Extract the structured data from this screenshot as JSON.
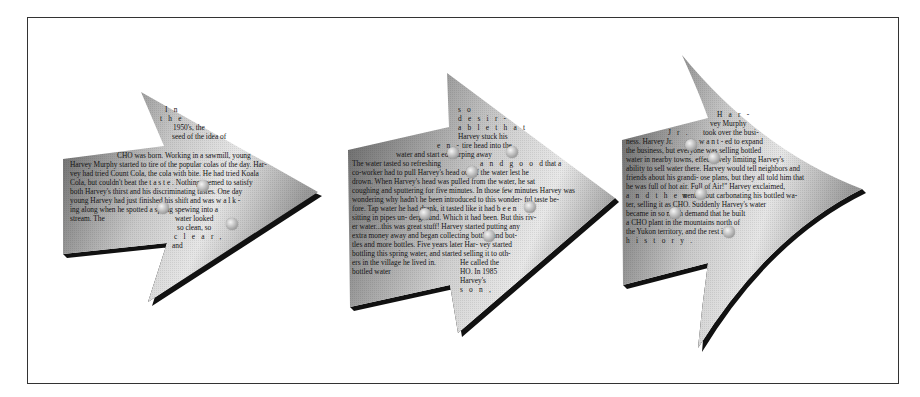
{
  "panels": [
    {
      "id": "arrow-1",
      "lines": [
        {
          "text": "I n",
          "x": 165,
          "y": 112,
          "spaced": true
        },
        {
          "text": "t h e",
          "x": 160,
          "y": 121,
          "spaced": true
        },
        {
          "text": "1950's, the",
          "x": 173,
          "y": 130
        },
        {
          "text": "seed of the idea of",
          "x": 172,
          "y": 139
        },
        {
          "text": "CHO was born. Working in a sawmill, young",
          "x": 117,
          "y": 158
        },
        {
          "text": "Harvey Murphy started to tire of the popular colas of the day. Har-",
          "x": 70,
          "y": 167
        },
        {
          "text": "vey had tried Count Cola, the cola with     bite. He had tried Koala",
          "x": 70,
          "y": 176
        },
        {
          "text": "Cola, but couldn't beat the      t a s t e .   Nothing seemed to satisfy",
          "x": 70,
          "y": 185
        },
        {
          "text": "both Harvey's thirst and his      discriminating tastes. One day",
          "x": 70,
          "y": 194
        },
        {
          "text": "young Harvey had just finished his shift and was       w a l k -",
          "x": 70,
          "y": 203
        },
        {
          "text": "ing along when he spotted a spring spewing into      a",
          "x": 70,
          "y": 212
        },
        {
          "text": "stream. The",
          "x": 70,
          "y": 221
        },
        {
          "text": "water looked",
          "x": 175,
          "y": 221
        },
        {
          "text": "so clean, so",
          "x": 177,
          "y": 230
        },
        {
          "text": "c l e a r ,",
          "x": 174,
          "y": 239,
          "spaced": true
        },
        {
          "text": "and",
          "x": 172,
          "y": 248
        }
      ],
      "bubbles": [
        [
          203,
          186
        ],
        [
          163,
          208
        ],
        [
          232,
          224
        ]
      ]
    },
    {
      "id": "arrow-2",
      "lines": [
        {
          "text": "s o",
          "x": 458,
          "y": 112,
          "spaced": true
        },
        {
          "text": "d e s i r -",
          "x": 458,
          "y": 121,
          "spaced": true
        },
        {
          "text": "a b l e  t h a t",
          "x": 458,
          "y": 130,
          "spaced": true
        },
        {
          "text": "Harvey stuck his",
          "x": 458,
          "y": 139
        },
        {
          "text": "e n -",
          "x": 437,
          "y": 148,
          "spaced": true
        },
        {
          "text": "tire head into the",
          "x": 462,
          "y": 148
        },
        {
          "text": "water and start      ed slurping away",
          "x": 396,
          "y": 157
        },
        {
          "text": "The water tasted so refreshing",
          "x": 352,
          "y": 166
        },
        {
          "text": "a n d  g o o d",
          "x": 480,
          "y": 166,
          "spaced": true
        },
        {
          "text": "that a",
          "x": 545,
          "y": 166
        },
        {
          "text": "co-worker had to pull Harvey's head      out of the water lest he",
          "x": 352,
          "y": 175
        },
        {
          "text": "drown. When Harvey's head was    pulled from the water, he sat",
          "x": 352,
          "y": 184
        },
        {
          "text": "coughing and sputtering for five minutes. In those few minutes Harvey was",
          "x": 352,
          "y": 193
        },
        {
          "text": "wondering why hadn't he been introduced to this wonder-      ful taste be-",
          "x": 352,
          "y": 202
        },
        {
          "text": "fore. Tap water he      had drank, it tasted like it had      b e e n",
          "x": 352,
          "y": 211
        },
        {
          "text": "sitting in pipes un-      derground. Which it had been. But this riv-",
          "x": 352,
          "y": 220
        },
        {
          "text": "er water...this was great stuff! Harvey      started putting any",
          "x": 352,
          "y": 229
        },
        {
          "text": "extra money away and began collecting      bottles and bot-",
          "x": 352,
          "y": 238
        },
        {
          "text": "tles and more bottles. Five years later Har-  vey started",
          "x": 352,
          "y": 247
        },
        {
          "text": "bottling this spring water, and started selling it to oth-",
          "x": 352,
          "y": 256
        },
        {
          "text": "ers in the village he lived in.",
          "x": 352,
          "y": 265
        },
        {
          "text": "He called the",
          "x": 460,
          "y": 265
        },
        {
          "text": "bottled water",
          "x": 352,
          "y": 274
        },
        {
          "text": "HO. In 1985",
          "x": 460,
          "y": 274
        },
        {
          "text": "Harvey's",
          "x": 460,
          "y": 283
        },
        {
          "text": "s o n ,",
          "x": 460,
          "y": 292,
          "spaced": true
        }
      ],
      "bubbles": [
        [
          453,
          153
        ],
        [
          512,
          152
        ],
        [
          472,
          172
        ],
        [
          530,
          207
        ],
        [
          425,
          214
        ],
        [
          489,
          236
        ]
      ]
    },
    {
      "id": "arrow-3",
      "lines": [
        {
          "text": "H a r -",
          "x": 717,
          "y": 117,
          "spaced": true
        },
        {
          "text": "vey Murphy",
          "x": 710,
          "y": 126
        },
        {
          "text": "J r .",
          "x": 668,
          "y": 135,
          "spaced": true
        },
        {
          "text": "took over the busi-",
          "x": 703,
          "y": 135
        },
        {
          "text": "ness. Harvey Jr.",
          "x": 626,
          "y": 144
        },
        {
          "text": "w a n t - ed to expand",
          "x": 699,
          "y": 144
        },
        {
          "text": "the business, but everyone      was selling bottled",
          "x": 626,
          "y": 153
        },
        {
          "text": "water in nearby towns, effec-      tively limiting Harvey's",
          "x": 626,
          "y": 162
        },
        {
          "text": "ability to sell water there. Harvey would tell neighbors and",
          "x": 626,
          "y": 171
        },
        {
          "text": "friends about his grandi-      ose plans, but they all told him that",
          "x": 626,
          "y": 180
        },
        {
          "text": "he was full of hot air.      Full of Air!\" Harvey exclaimed,",
          "x": 626,
          "y": 189
        },
        {
          "text": "a n d  t h e n",
          "x": 626,
          "y": 198,
          "spaced": true
        },
        {
          "text": "went about carbonating his bottled wa-",
          "x": 682,
          "y": 198
        },
        {
          "text": "ter, selling      it as CHO. Suddenly Harvey's water",
          "x": 626,
          "y": 207
        },
        {
          "text": "became in so much demand      that he built",
          "x": 626,
          "y": 216
        },
        {
          "text": "a CHO plant in the mountains      north of",
          "x": 626,
          "y": 225
        },
        {
          "text": "the Yukon territory, and      the rest is",
          "x": 626,
          "y": 234
        },
        {
          "text": "h i s t o r y .",
          "x": 626,
          "y": 243,
          "spaced": true
        }
      ],
      "bubbles": [
        [
          691,
          145
        ],
        [
          714,
          158
        ],
        [
          701,
          194
        ],
        [
          675,
          213
        ],
        [
          729,
          232
        ]
      ]
    }
  ]
}
